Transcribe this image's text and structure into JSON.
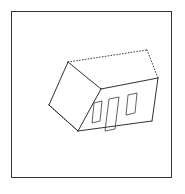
{
  "figure": {
    "frame": {
      "visible": true,
      "stroke_color": "#333333",
      "x": 11,
      "y": 11,
      "width": 161,
      "height": 167
    },
    "background_color": "#ffffff",
    "stroke_color": "#1a1a1a",
    "hidden_stroke_color": "#1a1a1a",
    "opening_stroke_color": "#3a3a3a"
  },
  "geometry": {
    "visible_edges": [
      {
        "name": "roof-ridge-left-slope",
        "points": "68,62 101,89"
      },
      {
        "name": "gable-left-upper",
        "points": "68,62 49,105"
      },
      {
        "name": "gable-left-lower",
        "points": "49,105 78,131"
      },
      {
        "name": "gable-bottom-right",
        "points": "78,131 101,89"
      },
      {
        "name": "roof-eave-front",
        "points": "101,89 158,78"
      },
      {
        "name": "front-wall-bottom",
        "points": "78,131 152,121"
      },
      {
        "name": "front-right-corner",
        "points": "158,78 152,121"
      }
    ],
    "hidden_edges": [
      {
        "name": "roof-ridge-top",
        "points": "68,62 147,50"
      },
      {
        "name": "roof-rear-right-slope",
        "points": "147,50 158,78"
      },
      {
        "name": "rear-bottom-left",
        "points": "49,105 78,131"
      }
    ],
    "openings": [
      {
        "name": "window-left",
        "points": "94,103 102,101 100,121 92,123"
      },
      {
        "name": "door-center",
        "points": "109,99 119,97 115,129 105,131"
      },
      {
        "name": "window-right",
        "points": "128,95 137,93 135,113 126,115"
      }
    ]
  }
}
